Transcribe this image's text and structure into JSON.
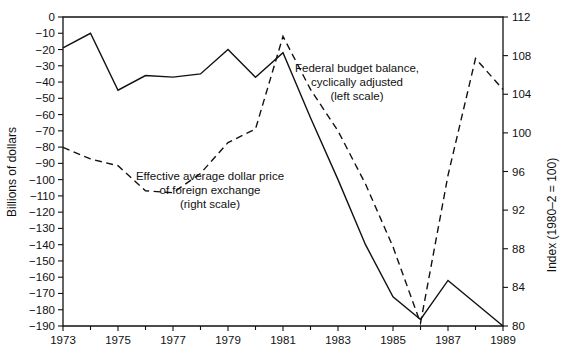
{
  "chart_data": {
    "type": "line",
    "title": "",
    "xlabel": "",
    "ylabel": "Billions of dollars",
    "y2label": "Index (1980–2 = 100)",
    "x": [
      1973,
      1974,
      1975,
      1976,
      1977,
      1978,
      1979,
      1980,
      1981,
      1982,
      1983,
      1984,
      1985,
      1986,
      1987,
      1988,
      1989
    ],
    "xlim": [
      1973,
      1989
    ],
    "ylim": [
      -190,
      0
    ],
    "y2lim": [
      80,
      112
    ],
    "grid": false,
    "legend_position": "inline-annotations",
    "x_tick_labels": [
      "1973",
      "1975",
      "1977",
      "1979",
      "1981",
      "1983",
      "1985",
      "1987",
      "1989"
    ],
    "x_tick_values": [
      1973,
      1975,
      1977,
      1979,
      1981,
      1983,
      1985,
      1987,
      1989
    ],
    "x_minor_tick_values": [
      1974,
      1976,
      1978,
      1980,
      1982,
      1984,
      1986,
      1988
    ],
    "y_tick_labels": [
      "0",
      "−10",
      "−20",
      "−30",
      "−40",
      "−50",
      "−60",
      "−70",
      "−80",
      "−90",
      "−100",
      "−110",
      "−120",
      "−130",
      "−140",
      "−150",
      "−160",
      "−170",
      "−180",
      "−190"
    ],
    "y_tick_values": [
      0,
      -10,
      -20,
      -30,
      -40,
      -50,
      -60,
      -70,
      -80,
      -90,
      -100,
      -110,
      -120,
      -130,
      -140,
      -150,
      -160,
      -170,
      -180,
      -190
    ],
    "y2_tick_labels": [
      "112",
      "108",
      "104",
      "100",
      "96",
      "92",
      "88",
      "84",
      "80"
    ],
    "y2_tick_values": [
      112,
      108,
      104,
      100,
      96,
      92,
      88,
      84,
      80
    ],
    "series": [
      {
        "name": "Federal budget balance, cyclically adjusted",
        "axis": "left",
        "style": "solid",
        "values": [
          -19,
          -10,
          -45,
          -36,
          -37,
          -35,
          -20,
          -37,
          -22,
          -62,
          -100,
          -140,
          -172,
          -186,
          -162,
          -176,
          -190
        ]
      },
      {
        "name": "Effective average dollar price of foreign exchange",
        "axis": "right",
        "style": "dashed",
        "values": [
          98.5,
          97.3,
          96.6,
          94.0,
          93.8,
          95.8,
          99.0,
          100.4,
          110.0,
          104.5,
          100.2,
          94.7,
          88.2,
          80.3,
          95.6,
          107.7,
          104.5
        ]
      }
    ],
    "annotations": [
      {
        "name": "solid-series-label",
        "lines": [
          "Federal budget balance,",
          "cyclically adjusted",
          "(left scale)"
        ],
        "x": 357,
        "y": 72
      },
      {
        "name": "dashed-series-label",
        "lines": [
          "Effective average dollar price",
          "of foreign exchange",
          "(right scale)"
        ],
        "x": 210,
        "y": 180
      }
    ]
  },
  "annotation_solid": {
    "line1": "Federal budget balance,",
    "line2": "cyclically adjusted",
    "line3": "(left scale)"
  },
  "annotation_dashed": {
    "line1": "Effective average dollar price",
    "line2": "of foreign exchange",
    "line3": "(right scale)"
  },
  "axes": {
    "left_title": "Billions of dollars",
    "right_title": "Index (1980–2 = 100)"
  }
}
